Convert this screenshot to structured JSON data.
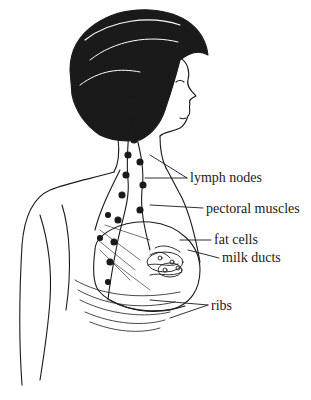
{
  "diagram": {
    "labels": [
      {
        "text": "lymph nodes",
        "x": 190,
        "y": 172
      },
      {
        "text": "pectoral muscles",
        "x": 206,
        "y": 203
      },
      {
        "text": "fat cells",
        "x": 214,
        "y": 234
      },
      {
        "text": "milk ducts",
        "x": 222,
        "y": 252
      },
      {
        "text": "ribs",
        "x": 211,
        "y": 300
      }
    ],
    "colors": {
      "line": "#1a1a1a",
      "background": "#ffffff"
    }
  }
}
